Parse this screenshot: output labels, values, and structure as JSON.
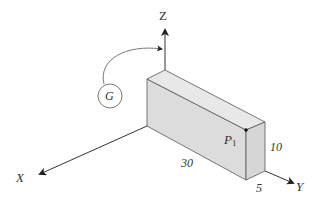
{
  "diagram": {
    "type": "3d-coordinate-box",
    "axes": {
      "x_label": "X",
      "y_label": "Y",
      "z_label": "Z"
    },
    "rotation_indicator": {
      "label": "G",
      "direction": "curved arrow from G toward Z axis"
    },
    "box": {
      "length_label": "30",
      "height_label": "10",
      "depth_label": "5",
      "fill_front": "#dcdcdc",
      "fill_top": "#e6e6e6",
      "fill_side": "#d4d4d4"
    },
    "point": {
      "label": "P",
      "subscript": "1"
    },
    "colors": {
      "line": "#444444",
      "axis": "#333333",
      "background": "#ffffff"
    }
  }
}
